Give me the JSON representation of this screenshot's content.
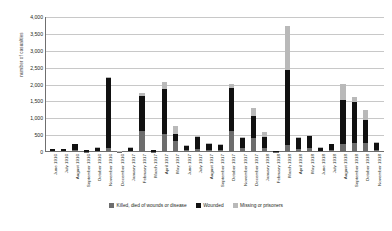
{
  "chart_data": {
    "type": "bar",
    "subtype": "stacked",
    "title": "",
    "xlabel": "",
    "ylabel": "number of casualties",
    "ylim": [
      0,
      4000
    ],
    "ytick_labels": [
      "4,000",
      "3,500",
      "3,000",
      "2,500",
      "2,000",
      "1,500",
      "1,000",
      "500",
      "0"
    ],
    "ytick_values": [
      4000,
      3500,
      3000,
      2500,
      2000,
      1500,
      1000,
      500,
      0
    ],
    "grid": true,
    "legend_position": "bottom",
    "categories": [
      "June 1916",
      "July 1916",
      "August 1916",
      "September 1916",
      "October 1916",
      "November 1916",
      "December 1916",
      "January 1917",
      "February 1917",
      "March 1917",
      "April 1917",
      "May 1917",
      "June 1917",
      "July 1917",
      "August 1917",
      "September 1917",
      "October 1917",
      "November 1917",
      "December 1917",
      "January 1918",
      "February 1918",
      "March 1918",
      "April 1918",
      "May 1918",
      "June 1918",
      "July 1918",
      "August 1918",
      "September 1918",
      "October 1918",
      "November 1918"
    ],
    "series": [
      {
        "name": "Killed, died of wounds or disease",
        "color": "#6d6d6d",
        "values": [
          20,
          20,
          60,
          15,
          30,
          130,
          5,
          30,
          620,
          10,
          530,
          340,
          50,
          100,
          60,
          50,
          620,
          110,
          420,
          120,
          10,
          200,
          100,
          110,
          30,
          50,
          240,
          270,
          280,
          60
        ]
      },
      {
        "name": "Wounded",
        "color": "#111111",
        "values": [
          60,
          60,
          165,
          35,
          100,
          2060,
          10,
          100,
          1040,
          40,
          1330,
          200,
          140,
          350,
          180,
          170,
          1290,
          320,
          650,
          330,
          30,
          2230,
          330,
          370,
          100,
          180,
          1300,
          1200,
          680,
          220
        ]
      },
      {
        "name": "Missing or prisoners",
        "color": "#b9b9b9",
        "values": [
          5,
          5,
          10,
          5,
          10,
          20,
          2,
          5,
          90,
          5,
          220,
          220,
          10,
          20,
          15,
          10,
          110,
          20,
          230,
          150,
          5,
          1290,
          10,
          20,
          5,
          10,
          470,
          150,
          290,
          10
        ]
      }
    ],
    "totals": [
      85,
      85,
      235,
      55,
      140,
      2210,
      17,
      135,
      1750,
      55,
      2080,
      760,
      200,
      470,
      255,
      230,
      2020,
      450,
      1300,
      600,
      45,
      3720,
      440,
      500,
      135,
      240,
      2010,
      1620,
      1250,
      290
    ]
  },
  "legend": {
    "items": [
      {
        "label": "Killed, died of wounds or disease",
        "color": "#6d6d6d"
      },
      {
        "label": "Wounded",
        "color": "#111111"
      },
      {
        "label": "Missing or prisoners",
        "color": "#b9b9b9"
      }
    ]
  }
}
